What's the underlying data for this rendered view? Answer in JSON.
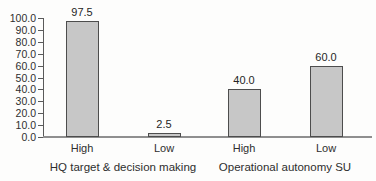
{
  "chart_data": {
    "type": "bar",
    "categories": [
      "High",
      "Low",
      "High",
      "Low"
    ],
    "values": [
      97.5,
      2.5,
      40.0,
      60.0
    ],
    "value_labels": [
      "97.5",
      "2.5",
      "40.0",
      "60.0"
    ],
    "group_labels": [
      "HQ target & decision making",
      "Operational autonomy SU"
    ],
    "group_of_bar": [
      0,
      0,
      1,
      1
    ],
    "title": "",
    "xlabel": "",
    "ylabel": "",
    "ylim": [
      0,
      100
    ],
    "ytick_step": 10,
    "ytick_labels": [
      "0.0",
      "10.0",
      "20.0",
      "30.0",
      "40.0",
      "50.0",
      "60.0",
      "70.0",
      "80.0",
      "90.0",
      "100.0"
    ],
    "grid": false,
    "legend": "none",
    "colors": {
      "bar_fill": "#c7c7c7",
      "bar_border": "#4d4d4d",
      "axis": "#5a5a5a",
      "baseline": "#8f8f8f",
      "text": "#2e2e2e",
      "background": "#fdfdfc"
    }
  }
}
